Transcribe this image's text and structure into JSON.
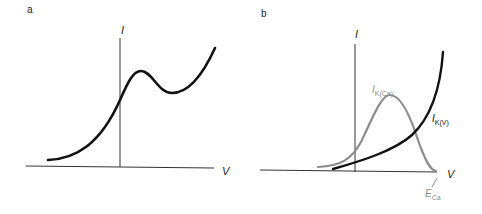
{
  "panels": {
    "a": {
      "label": "a",
      "y_axis_label": "I",
      "x_axis_label": "V"
    },
    "b": {
      "label": "b",
      "y_axis_label": "I",
      "x_axis_label": "V",
      "curve_gray_label_main": "I",
      "curve_gray_label_sub": "K(Ca)",
      "curve_black_label_main": "I",
      "curve_black_label_sub": "K(V)",
      "reversal_label_main": "E",
      "reversal_label_sub": "Ca"
    }
  },
  "colors": {
    "axis": "#333333",
    "black_curve": "#111111",
    "gray_curve": "#8c8c8c"
  }
}
